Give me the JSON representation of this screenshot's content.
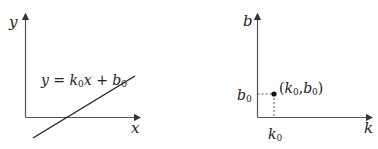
{
  "left_panel": {
    "y_axis_label": "y",
    "x_axis_label": "x",
    "equation": {
      "lhs": "y",
      "eq": " = ",
      "k": "k",
      "k_sub": "0",
      "x": "x",
      "plus": " + ",
      "b": "b",
      "b_sub": "0"
    }
  },
  "right_panel": {
    "y_axis_label": "b",
    "x_axis_label": "k",
    "b_tick": {
      "base": "b",
      "sub": "0"
    },
    "k_tick": {
      "base": "k",
      "sub": "0"
    },
    "point_label": {
      "open": "(",
      "k": "k",
      "k_sub": "0",
      "comma": ",",
      "b": "b",
      "b_sub": "0",
      "close": ")"
    }
  },
  "colors": {
    "ink": "#222222",
    "axis": "#555555"
  }
}
